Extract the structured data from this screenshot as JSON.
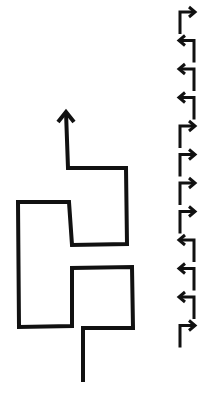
{
  "diagram": {
    "stroke_color": "#111111",
    "background": "#ffffff",
    "path": {
      "points": [
        [
          83,
          382
        ],
        [
          83,
          328
        ],
        [
          133,
          328
        ],
        [
          132,
          267
        ],
        [
          72,
          268
        ],
        [
          72,
          326
        ],
        [
          19,
          327
        ],
        [
          18,
          202
        ],
        [
          69,
          202
        ],
        [
          72,
          245
        ],
        [
          127,
          244
        ],
        [
          126,
          168
        ],
        [
          68,
          168
        ],
        [
          66,
          112
        ]
      ],
      "end_arrow": "up"
    },
    "turn_sequence": {
      "order": "top-to-bottom",
      "turns": [
        "right",
        "left",
        "left",
        "left",
        "right",
        "right",
        "right",
        "right",
        "left",
        "left",
        "left",
        "right"
      ]
    }
  }
}
